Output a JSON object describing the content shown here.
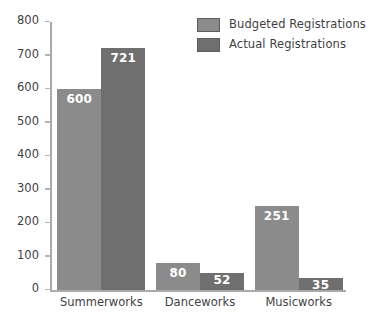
{
  "chart_data": {
    "type": "bar",
    "title": "",
    "xlabel": "",
    "ylabel": "",
    "categories": [
      "Summerworks",
      "Danceworks",
      "Musicworks"
    ],
    "series": [
      {
        "name": "Budgeted Registrations",
        "color": "#8b8b8b",
        "values": [
          600,
          80,
          251
        ]
      },
      {
        "name": "Actual Registrations",
        "color": "#6f6f6f",
        "values": [
          721,
          52,
          35
        ]
      }
    ],
    "ylim": [
      0,
      800
    ],
    "yticks": [
      0,
      100,
      200,
      300,
      400,
      500,
      600,
      700,
      800
    ],
    "ytick_labels": [
      "0",
      "100",
      "200",
      "300",
      "400",
      "500",
      "600",
      "700",
      "800"
    ],
    "grid": false,
    "legend_position": "top-right",
    "value_labels": true,
    "background": "#ffffff",
    "axis_color": "#aaaaaa",
    "text_color": "#3f3f3f",
    "label_color": "#ffffff"
  }
}
